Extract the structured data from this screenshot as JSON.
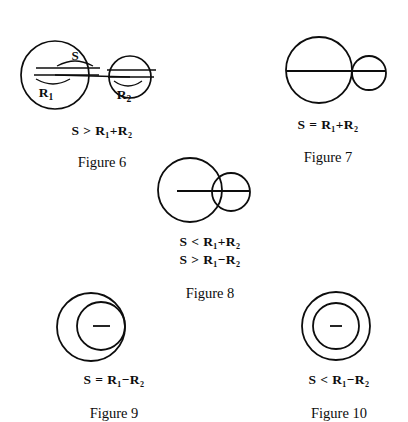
{
  "document": {
    "kind": "geometry-figure-plate",
    "topic": "Relative positions of two circles by centre distance S and radii R1, R2",
    "ink_color": "#0d0d0d",
    "background_color": "#ffffff"
  },
  "figures": [
    {
      "id": "figure-6",
      "label": "Figure 6",
      "case_name": "separate-circles",
      "relations": [
        "S > R₁+R₂"
      ],
      "relation_parts": [
        {
          "lhs": "S",
          "operator": ">",
          "rhs_first": "R",
          "rhs_first_sub": "1",
          "joiner": "+",
          "rhs_second": "R",
          "rhs_second_sub": "2"
        }
      ],
      "annotations": [
        {
          "name": "distance-label",
          "text": "S"
        },
        {
          "name": "radius-label-left",
          "text": "R",
          "subscript": "1"
        },
        {
          "name": "radius-label-right",
          "text": "R",
          "subscript": "2"
        }
      ],
      "geometry": {
        "large_circle": {
          "cx": 51,
          "cy": 57,
          "r": 34
        },
        "small_circle": {
          "cx": 126,
          "cy": 59,
          "r": 21
        },
        "centre_line": {
          "x1": 51,
          "y1": 57,
          "x2": 126,
          "y2": 59
        }
      }
    },
    {
      "id": "figure-7",
      "label": "Figure 7",
      "case_name": "externally-tangent-circles",
      "relations": [
        "S = R₁+R₂"
      ],
      "relation_parts": [
        {
          "lhs": "S",
          "operator": "=",
          "rhs_first": "R",
          "rhs_first_sub": "1",
          "joiner": "+",
          "rhs_second": "R",
          "rhs_second_sub": "2"
        }
      ],
      "annotations": [],
      "geometry": {
        "large_circle": {
          "cx": 67,
          "cy": 52,
          "r": 33
        },
        "small_circle": {
          "cx": 117,
          "cy": 55,
          "r": 17
        },
        "centre_line": {
          "x1": 34,
          "y1": 53,
          "x2": 134,
          "y2": 53
        }
      }
    },
    {
      "id": "figure-8",
      "label": "Figure 8",
      "case_name": "intersecting-circles",
      "relations": [
        "S < R₁+R₂",
        "S > R₁−R₂"
      ],
      "relation_parts": [
        {
          "lhs": "S",
          "operator": "<",
          "rhs_first": "R",
          "rhs_first_sub": "1",
          "joiner": "+",
          "rhs_second": "R",
          "rhs_second_sub": "2"
        },
        {
          "lhs": "S",
          "operator": ">",
          "rhs_first": "R",
          "rhs_first_sub": "1",
          "joiner": "−",
          "rhs_second": "R",
          "rhs_second_sub": "2"
        }
      ],
      "annotations": [],
      "geometry": {
        "large_circle": {
          "cx": 58,
          "cy": 42,
          "r": 32
        },
        "small_circle": {
          "cx": 99,
          "cy": 44,
          "r": 19
        },
        "centre_line": {
          "x1": 45,
          "y1": 43,
          "x2": 118,
          "y2": 43
        }
      }
    },
    {
      "id": "figure-9",
      "label": "Figure 9",
      "case_name": "internally-tangent-circles",
      "relations": [
        "S = R₁−R₂"
      ],
      "relation_parts": [
        {
          "lhs": "S",
          "operator": "=",
          "rhs_first": "R",
          "rhs_first_sub": "1",
          "joiner": "−",
          "rhs_second": "R",
          "rhs_second_sub": "2"
        }
      ],
      "annotations": [],
      "geometry": {
        "large_circle": {
          "cx": 53,
          "cy": 37,
          "r": 34
        },
        "small_circle": {
          "cx": 63,
          "cy": 36,
          "r": 24
        },
        "centre_tick": {
          "x1": 55,
          "y1": 36,
          "x2": 72,
          "y2": 36
        }
      }
    },
    {
      "id": "figure-10",
      "label": "Figure 10",
      "case_name": "nested-circles",
      "relations": [
        "S < R₁−R₂"
      ],
      "relation_parts": [
        {
          "lhs": "S",
          "operator": "<",
          "rhs_first": "R",
          "rhs_first_sub": "1",
          "joiner": "−",
          "rhs_second": "R",
          "rhs_second_sub": "2"
        }
      ],
      "annotations": [],
      "geometry": {
        "large_circle": {
          "cx": 64,
          "cy": 36,
          "r": 34
        },
        "small_circle": {
          "cx": 64,
          "cy": 36,
          "r": 23
        },
        "centre_tick": {
          "x1": 58,
          "y1": 36,
          "x2": 70,
          "y2": 36
        }
      }
    }
  ]
}
